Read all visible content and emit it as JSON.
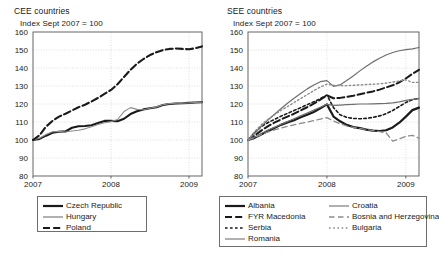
{
  "chart_data": [
    {
      "type": "line",
      "panel": "left",
      "title": "CEE countries",
      "subtitle": "Index Sept 2007 = 100",
      "xlabel": "",
      "ylabel": "",
      "ylim": [
        80,
        160
      ],
      "yticks": [
        80,
        90,
        100,
        110,
        120,
        130,
        140,
        150,
        160
      ],
      "xticks": [
        "2007",
        "2008",
        "2009"
      ],
      "xtick_positions": [
        0,
        12,
        24
      ],
      "xlim": [
        0,
        26
      ],
      "grid": true,
      "legend_position": "below",
      "x": [
        0,
        1,
        2,
        3,
        4,
        5,
        6,
        7,
        8,
        9,
        10,
        11,
        12,
        13,
        14,
        15,
        16,
        17,
        18,
        19,
        20,
        21,
        22,
        23,
        24,
        25,
        26
      ],
      "series": [
        {
          "name": "Czech Republic",
          "style": "solid",
          "color": "#1a1a1a",
          "width": 2.1,
          "values": [
            100,
            100.6,
            102.4,
            104.0,
            104.6,
            104.8,
            106.8,
            107.6,
            107.8,
            108.2,
            109.4,
            110.6,
            110.6,
            110.4,
            111.8,
            114.4,
            116.0,
            117.0,
            117.6,
            118.2,
            119.4,
            120.0,
            120.3,
            120.4,
            120.6,
            120.8,
            121.0
          ]
        },
        {
          "name": "Hungary",
          "style": "solid",
          "color": "#8c8c8c",
          "width": 1.1,
          "values": [
            100,
            101.0,
            103.0,
            104.6,
            104.8,
            104.4,
            105.0,
            105.4,
            106.2,
            107.4,
            108.6,
            109.6,
            110.2,
            111.4,
            115.8,
            118.0,
            117.0,
            116.8,
            117.6,
            118.4,
            119.6,
            120.2,
            120.4,
            120.5,
            120.6,
            120.8,
            121.0
          ]
        },
        {
          "name": "Poland",
          "style": "dashed",
          "color": "#1a1a1a",
          "width": 2.1,
          "values": [
            100,
            102.6,
            107.4,
            110.6,
            113.0,
            114.6,
            116.4,
            118.2,
            119.6,
            121.4,
            123.4,
            125.6,
            127.8,
            131.0,
            135.0,
            139.0,
            142.4,
            145.0,
            147.2,
            148.8,
            150.0,
            150.6,
            150.8,
            150.6,
            150.4,
            151.0,
            152.0
          ]
        }
      ]
    },
    {
      "type": "line",
      "panel": "right",
      "title": "SEE countries",
      "subtitle": "Index Sept 2007 = 100",
      "xlabel": "",
      "ylabel": "",
      "ylim": [
        80,
        160
      ],
      "yticks": [
        80,
        90,
        100,
        110,
        120,
        130,
        140,
        150,
        160
      ],
      "xticks": [
        "2007",
        "2008",
        "2009"
      ],
      "xtick_positions": [
        0,
        12,
        24
      ],
      "xlim": [
        0,
        26
      ],
      "grid": true,
      "legend_position": "below",
      "x": [
        0,
        1,
        2,
        3,
        4,
        5,
        6,
        7,
        8,
        9,
        10,
        11,
        12,
        13,
        14,
        15,
        16,
        17,
        18,
        19,
        20,
        21,
        22,
        23,
        24,
        25,
        26
      ],
      "series": [
        {
          "name": "Albania",
          "style": "solid",
          "color": "#1a1a1a",
          "width": 2.2,
          "values": [
            100,
            101.2,
            103.0,
            105.0,
            106.6,
            108.4,
            109.8,
            111.0,
            112.6,
            114.0,
            115.6,
            117.6,
            119.8,
            113.0,
            110.4,
            108.4,
            107.2,
            106.6,
            105.8,
            105.2,
            105.0,
            105.4,
            107.0,
            109.6,
            113.0,
            116.6,
            118.0
          ]
        },
        {
          "name": "FYR Macedonia",
          "style": "dashed",
          "color": "#1a1a1a",
          "width": 2.0,
          "values": [
            100,
            102.4,
            105.2,
            107.6,
            109.6,
            111.4,
            113.0,
            114.6,
            116.4,
            118.2,
            120.2,
            122.4,
            124.8,
            123.2,
            123.4,
            124.0,
            124.6,
            125.4,
            126.2,
            127.0,
            128.0,
            129.2,
            130.4,
            132.0,
            134.2,
            136.8,
            139.0
          ]
        },
        {
          "name": "Serbia",
          "style": "dotted-dash",
          "color": "#1a1a1a",
          "width": 1.6,
          "values": [
            100,
            104.0,
            107.4,
            109.6,
            111.4,
            113.2,
            114.8,
            116.4,
            118.0,
            119.6,
            121.2,
            123.0,
            125.0,
            118.0,
            114.0,
            112.6,
            112.0,
            111.8,
            112.0,
            112.6,
            113.4,
            114.6,
            116.4,
            118.6,
            120.8,
            122.4,
            123.2
          ]
        },
        {
          "name": "Romania",
          "style": "solid",
          "color": "#6e6e6e",
          "width": 1.2,
          "values": [
            100,
            101.6,
            103.6,
            105.4,
            107.0,
            108.6,
            110.2,
            111.8,
            113.4,
            115.0,
            116.6,
            118.2,
            119.8,
            119.2,
            119.4,
            119.6,
            119.8,
            120.0,
            120.0,
            120.1,
            120.2,
            120.3,
            120.6,
            121.2,
            122.0,
            122.6,
            123.0
          ]
        },
        {
          "name": "Croatia",
          "style": "solid",
          "color": "#6e6e6e",
          "width": 1.2,
          "values": [
            100,
            103.6,
            107.6,
            111.0,
            114.2,
            117.4,
            120.4,
            123.2,
            125.8,
            128.4,
            130.6,
            132.4,
            133.0,
            129.8,
            130.6,
            133.0,
            135.6,
            138.4,
            141.0,
            143.4,
            145.4,
            147.2,
            148.6,
            149.6,
            150.2,
            150.6,
            151.4
          ]
        },
        {
          "name": "Bosnia and Herzegovina",
          "style": "long-dash",
          "color": "#8c8c8c",
          "width": 1.3,
          "values": [
            100,
            101.4,
            103.0,
            104.4,
            105.6,
            106.6,
            107.6,
            108.4,
            109.2,
            110.0,
            110.8,
            111.6,
            112.4,
            110.6,
            109.0,
            107.8,
            107.0,
            106.4,
            105.8,
            105.2,
            104.6,
            104.0,
            99.4,
            100.6,
            102.0,
            102.6,
            101.0
          ]
        },
        {
          "name": "Bulgaria",
          "style": "dotted",
          "color": "#8c8c8c",
          "width": 1.4,
          "values": [
            100,
            104.6,
            108.4,
            111.4,
            114.0,
            116.4,
            118.6,
            120.8,
            123.0,
            125.2,
            127.4,
            129.4,
            131.0,
            130.4,
            130.2,
            130.2,
            130.4,
            130.6,
            130.8,
            131.0,
            131.2,
            131.6,
            132.2,
            132.8,
            133.4,
            132.0,
            132.0
          ]
        }
      ]
    }
  ],
  "left_panel": {
    "title": "CEE countries",
    "subtitle": "Index Sept 2007 = 100",
    "yticks": [
      "160",
      "150",
      "140",
      "130",
      "120",
      "110",
      "100",
      "90",
      "80"
    ],
    "xticks": [
      "2007",
      "2008",
      "2009"
    ],
    "legend": [
      {
        "label": "Czech Republic",
        "style": "solid-thick-black"
      },
      {
        "label": "Hungary",
        "style": "solid-thin-gray"
      },
      {
        "label": "Poland",
        "style": "dashed-thick-black"
      }
    ]
  },
  "right_panel": {
    "title": "SEE countries",
    "subtitle": "Index Sept 2007 = 100",
    "yticks": [
      "160",
      "150",
      "140",
      "130",
      "120",
      "110",
      "100",
      "90",
      "80"
    ],
    "xticks": [
      "2007",
      "2008",
      "2009"
    ],
    "legend_col1": [
      {
        "label": "Albania",
        "style": "solid-thick-black"
      },
      {
        "label": "FYR Macedonia",
        "style": "dashed-thick-black"
      },
      {
        "label": "Serbia",
        "style": "dotted-dash-black"
      },
      {
        "label": "Romania",
        "style": "solid-thin-gray"
      }
    ],
    "legend_col2": [
      {
        "label": "Croatia",
        "style": "solid-thin-gray"
      },
      {
        "label": "Bosnia and Herzegovina",
        "style": "long-dash-gray"
      },
      {
        "label": "Bulgaria",
        "style": "dotted-gray"
      }
    ]
  }
}
